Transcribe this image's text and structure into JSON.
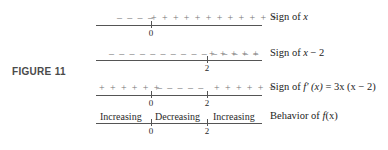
{
  "figure": {
    "label": "FIGURE 11"
  },
  "rows": [
    {
      "segments": [
        "– – – –",
        "+ + + + + + + + + + + +"
      ],
      "description_pre": "Sign of ",
      "description_var": "x",
      "description_post": "",
      "ticks": [
        {
          "label": "0"
        }
      ]
    },
    {
      "segments": [
        "– – – – – – – – – – – – – – –",
        "+ + + + +"
      ],
      "description_pre": "Sign of ",
      "description_var": "x",
      "description_post": " − 2",
      "ticks": [
        {
          "label": "2"
        }
      ]
    },
    {
      "segments": [
        "+ + + + + +",
        "– – – – –",
        "+ + + + + +"
      ],
      "description_pre": "Sign of ",
      "description_var": "f′ (x)",
      "description_post": " = 3x (x − 2)",
      "ticks": [
        {
          "label": "0"
        },
        {
          "label": "2"
        }
      ]
    },
    {
      "segments": [
        "Increasing",
        "Decreasing",
        "Increasing"
      ],
      "description_pre": "Behavior of ",
      "description_var": "f",
      "description_post": "(x)",
      "ticks": [
        {
          "label": "0"
        },
        {
          "label": "2"
        }
      ]
    }
  ]
}
